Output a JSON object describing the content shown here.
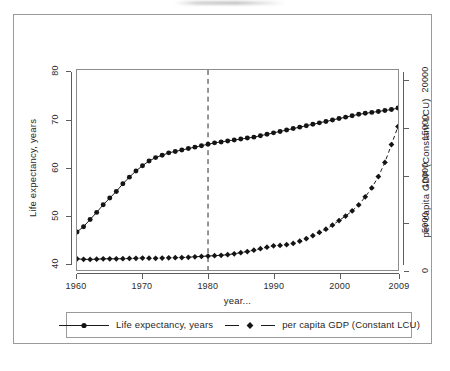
{
  "figure": {
    "x_axis_title": "year...",
    "left_axis_title": "Life expectancy, years",
    "right_axis_title": "per capita GDP (Constant LCU)",
    "x_tick_labels": [
      "1960",
      "1970",
      "1980",
      "1990",
      "2000",
      "2009"
    ],
    "left_tick_labels": [
      "40",
      "50",
      "60",
      "70",
      "80"
    ],
    "right_tick_labels": [
      "0",
      "5000",
      "10000",
      "15000",
      "20000"
    ],
    "legend": [
      {
        "label": "Life expectancy, years",
        "marker": "circle-marker",
        "line": "solid"
      },
      {
        "label": "per capita GDP (Constant LCU)",
        "marker": "diamond-marker",
        "line": "dashed"
      }
    ],
    "colors": {
      "ink": "#1a1a1a",
      "axis": "#5d5d5d",
      "frame": "#9a9a9a"
    }
  },
  "chart_data": {
    "type": "line",
    "title": "",
    "xlabel": "year...",
    "ylabel": "Life expectancy, years",
    "y2label": "per capita GDP (Constant LCU)",
    "xlim": [
      1960,
      2009
    ],
    "ylim": [
      38.5,
      80.5
    ],
    "y2lim": [
      0,
      21200
    ],
    "xticks": [
      1960,
      1970,
      1980,
      1990,
      2000,
      2009
    ],
    "yticks": [
      40,
      50,
      60,
      70,
      80
    ],
    "y2ticks": [
      0,
      5000,
      10000,
      15000,
      20000
    ],
    "grid": false,
    "legend_position": "below-axes",
    "annotations": [
      {
        "type": "vertical-dashed-line",
        "x": 1980,
        "label": ""
      }
    ],
    "x": [
      1960,
      1961,
      1962,
      1963,
      1964,
      1965,
      1966,
      1967,
      1968,
      1969,
      1970,
      1971,
      1972,
      1973,
      1974,
      1975,
      1976,
      1977,
      1978,
      1979,
      1980,
      1981,
      1982,
      1983,
      1984,
      1985,
      1986,
      1987,
      1988,
      1989,
      1990,
      1991,
      1992,
      1993,
      1994,
      1995,
      1996,
      1997,
      1998,
      1999,
      2000,
      2001,
      2002,
      2003,
      2004,
      2005,
      2006,
      2007,
      2008,
      2009
    ],
    "series": [
      {
        "name": "Life expectancy, years",
        "axis": "left",
        "marker": "circle",
        "linestyle": "solid",
        "values": [
          46.5,
          47.6,
          49.1,
          50.6,
          52.2,
          53.6,
          55.0,
          56.6,
          58.0,
          59.3,
          60.4,
          61.4,
          62.1,
          62.6,
          63.1,
          63.4,
          63.7,
          64.0,
          64.3,
          64.6,
          64.9,
          65.2,
          65.4,
          65.6,
          65.8,
          66.0,
          66.2,
          66.4,
          66.7,
          67.0,
          67.3,
          67.6,
          67.9,
          68.2,
          68.5,
          68.8,
          69.1,
          69.4,
          69.7,
          70.0,
          70.3,
          70.6,
          70.9,
          71.2,
          71.4,
          71.6,
          71.8,
          72.0,
          72.2,
          72.5
        ]
      },
      {
        "name": "per capita GDP (Constant LCU)",
        "axis": "right",
        "marker": "diamond",
        "linestyle": "dashed",
        "values": [
          1180,
          1130,
          1120,
          1150,
          1180,
          1190,
          1180,
          1200,
          1220,
          1240,
          1260,
          1250,
          1240,
          1270,
          1290,
          1300,
          1320,
          1350,
          1400,
          1440,
          1480,
          1520,
          1560,
          1620,
          1720,
          1840,
          1960,
          2100,
          2260,
          2420,
          2560,
          2600,
          2680,
          2820,
          3050,
          3320,
          3640,
          3980,
          4320,
          4760,
          5240,
          5720,
          6260,
          6900,
          7760,
          8700,
          9900,
          11400,
          13300,
          15200
        ]
      }
    ]
  }
}
